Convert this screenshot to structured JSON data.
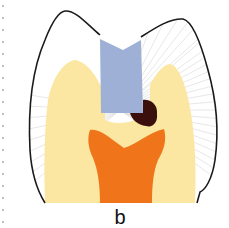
{
  "figure": {
    "label": "b",
    "colors": {
      "outline": "#1a1a1a",
      "enamel": "#ffffff",
      "enamel_hatch": "#c8c8c8",
      "dentin": "#fbe7a1",
      "filling": "#9fb0d6",
      "caries": "#3a0f0c",
      "pulp": "#f07419",
      "dotted_rule": "#9ab3b0"
    },
    "parts": [
      "enamel",
      "dentin",
      "filling",
      "caries",
      "pulp"
    ]
  }
}
